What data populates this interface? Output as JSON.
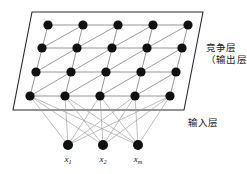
{
  "figure": {
    "background_color": "#ffffff"
  },
  "labels": {
    "competition_layer_line1": "竞争层",
    "competition_layer_line2": "（输出层）",
    "input_layer": "输入层"
  },
  "input_nodes": [
    {
      "id": "x1",
      "symbol": "x",
      "subscript": "1",
      "cx": 68,
      "cy": 145,
      "r": 5.0
    },
    {
      "id": "x2",
      "symbol": "x",
      "subscript": "2",
      "cx": 103,
      "cy": 145,
      "r": 5.0
    },
    {
      "id": "xm",
      "symbol": "x",
      "subscript": "m",
      "cx": 138,
      "cy": 145,
      "r": 5.0
    }
  ],
  "competition_layer": {
    "rows": 4,
    "cols": 5,
    "node_radius": 4.6,
    "plane_corners": [
      {
        "x": 32,
        "y": 12
      },
      {
        "x": 203,
        "y": 12
      },
      {
        "x": 184,
        "y": 110
      },
      {
        "x": 13,
        "y": 110
      }
    ],
    "grid_nodes": [
      [
        {
          "x": 48,
          "y": 25
        },
        {
          "x": 83,
          "y": 25
        },
        {
          "x": 118,
          "y": 25
        },
        {
          "x": 153,
          "y": 25
        },
        {
          "x": 188,
          "y": 25
        }
      ],
      [
        {
          "x": 42,
          "y": 48
        },
        {
          "x": 77,
          "y": 48
        },
        {
          "x": 112,
          "y": 48
        },
        {
          "x": 147,
          "y": 48
        },
        {
          "x": 182,
          "y": 48
        }
      ],
      [
        {
          "x": 36,
          "y": 72
        },
        {
          "x": 71,
          "y": 72
        },
        {
          "x": 106,
          "y": 72
        },
        {
          "x": 141,
          "y": 72
        },
        {
          "x": 176,
          "y": 72
        }
      ],
      [
        {
          "x": 30,
          "y": 96
        },
        {
          "x": 65,
          "y": 96
        },
        {
          "x": 100,
          "y": 96
        },
        {
          "x": 135,
          "y": 96
        },
        {
          "x": 170,
          "y": 96
        }
      ]
    ]
  },
  "colors": {
    "node_fill": "#111111",
    "grid_line": "#8a8a8a",
    "plane_border": "#2b2b2b",
    "connection_line": "#9a9a9a",
    "text": "#1a1a1a"
  }
}
